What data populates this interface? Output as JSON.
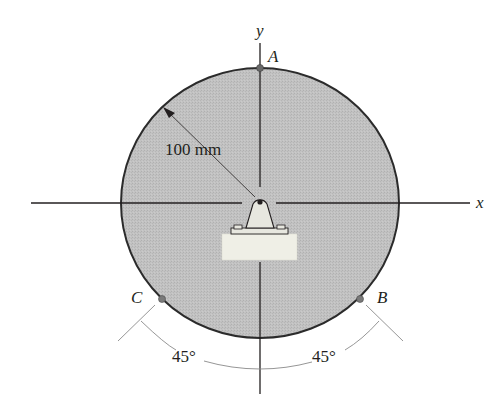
{
  "diagram": {
    "type": "mechanics-figure",
    "axes": {
      "x_label": "x",
      "y_label": "y"
    },
    "disk": {
      "radius_label": "100 mm",
      "fill_color": "#bdbdbd",
      "edge_color": "#2b2b2b"
    },
    "points": [
      {
        "id": "A",
        "label": "A",
        "position": "top on y-axis"
      },
      {
        "id": "B",
        "label": "B",
        "position": "lower right, 45° from vertical"
      },
      {
        "id": "C",
        "label": "C",
        "position": "lower left, 45° from vertical"
      }
    ],
    "angles": [
      {
        "label": "45°",
        "side": "left"
      },
      {
        "label": "45°",
        "side": "right"
      }
    ],
    "support": {
      "type": "pin-bracket",
      "label": ""
    }
  }
}
